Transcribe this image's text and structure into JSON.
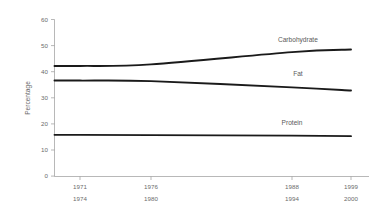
{
  "chart_data": {
    "type": "line",
    "title": "",
    "subtitle": "",
    "xlabel": "",
    "ylabel": "Percentage",
    "ylim": [
      0,
      60
    ],
    "yticks": [
      0,
      10,
      20,
      30,
      40,
      50,
      60
    ],
    "ytick_labels": [
      "0",
      "10",
      "20",
      "30",
      "40",
      "50",
      "60"
    ],
    "grid": false,
    "legend_position": "inline-right",
    "x": [
      0,
      1,
      2,
      3
    ],
    "categories": [
      "1971\n1974",
      "1976\n1980",
      "1988\n1994",
      "1999\n2000"
    ],
    "xtick_labels_line1": [
      "1971",
      "1976",
      "1988",
      "1999"
    ],
    "xtick_labels_line2": [
      "1974",
      "1980",
      "1994",
      "2000"
    ],
    "series": [
      {
        "name": "Carbohydrate",
        "values": [
          42.2,
          42.8,
          47.5,
          48.5
        ],
        "color": "#1a1a1a"
      },
      {
        "name": "Fat",
        "values": [
          36.6,
          36.4,
          34.0,
          32.8
        ],
        "color": "#1a1a1a"
      },
      {
        "name": "Protein",
        "values": [
          15.8,
          15.7,
          15.5,
          15.3
        ],
        "color": "#1a1a1a"
      }
    ],
    "annotations": [
      {
        "text": "Carbohydrate",
        "x": 2.1,
        "y": 51.5
      },
      {
        "text": "Fat",
        "x": 2.1,
        "y": 38.2
      },
      {
        "text": "Protein",
        "x": 2.0,
        "y": 19.6
      }
    ]
  },
  "axes": {
    "y_title": "Percentage",
    "y_tick_0": "0",
    "y_tick_10": "10",
    "y_tick_20": "20",
    "y_tick_30": "30",
    "y_tick_40": "40",
    "y_tick_50": "50",
    "y_tick_60": "60",
    "x_tick_1_top": "1971",
    "x_tick_1_bottom": "1974",
    "x_tick_2_top": "1976",
    "x_tick_2_bottom": "1980",
    "x_tick_3_top": "1988",
    "x_tick_3_bottom": "1994",
    "x_tick_4_top": "1999",
    "x_tick_4_bottom": "2000"
  },
  "labels": {
    "carbohydrate": "Carbohydrate",
    "fat": "Fat",
    "protein": "Protein"
  }
}
